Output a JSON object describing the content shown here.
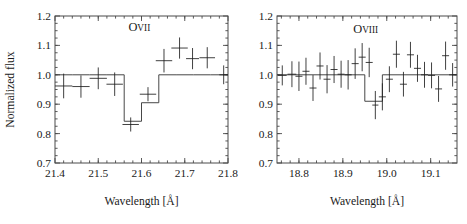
{
  "figure": {
    "background": "#ffffff",
    "ink_color": "#1a1a1a",
    "panel_count": 2
  },
  "axis_labels": {
    "x": "Wavelength [Å]",
    "y": "Normalized flux"
  },
  "chart_data": [
    {
      "type": "line",
      "panel": "left",
      "title": "",
      "annotation": {
        "text_major": "O",
        "text_minor": "VII",
        "x": 21.595,
        "y": 1.148
      },
      "xlabel": "Wavelength [Å]",
      "ylabel": "Normalized flux",
      "xlim": [
        21.4,
        21.8
      ],
      "ylim": [
        0.7,
        1.2
      ],
      "xticks": [
        21.4,
        21.5,
        21.6,
        21.7,
        21.8
      ],
      "xticklabels": [
        "21.4",
        "21.5",
        "21.6",
        "21.7",
        "21.8"
      ],
      "yticks": [
        0.7,
        0.8,
        0.9,
        1.0,
        1.1,
        1.2
      ],
      "yticklabels": [
        "0.7",
        "0.8",
        "0.9",
        "1.0",
        "1.1",
        "1.2"
      ],
      "xminor_step": 0.02,
      "yminor_step": 0.025,
      "grid": false,
      "legend": null,
      "series": [
        {
          "name": "model",
          "kind": "step",
          "edges": [
            21.4,
            21.44,
            21.48,
            21.52,
            21.56,
            21.6,
            21.64,
            21.68,
            21.72,
            21.76,
            21.8
          ],
          "values": [
            1.0,
            1.0,
            1.0,
            1.0,
            0.842,
            0.905,
            1.0,
            1.0,
            1.0,
            1.0
          ]
        },
        {
          "name": "data",
          "kind": "errorbar",
          "x": [
            21.42,
            21.46,
            21.5,
            21.538,
            21.575,
            21.615,
            21.652,
            21.688,
            21.718,
            21.752,
            21.79
          ],
          "xerr": [
            0.02,
            0.02,
            0.02,
            0.019,
            0.019,
            0.019,
            0.019,
            0.019,
            0.015,
            0.018,
            0.01
          ],
          "y": [
            0.962,
            0.96,
            0.988,
            0.968,
            0.831,
            0.934,
            1.048,
            1.091,
            1.055,
            1.058,
            1.0
          ],
          "yerr": [
            0.042,
            0.038,
            0.037,
            0.04,
            0.024,
            0.024,
            0.04,
            0.036,
            0.036,
            0.036,
            0.032
          ]
        }
      ]
    },
    {
      "type": "line",
      "panel": "right",
      "title": "",
      "annotation": {
        "text_major": "O",
        "text_minor": "VIII",
        "x": 18.952,
        "y": 1.142
      },
      "xlabel": "Wavelength [Å]",
      "ylabel": "",
      "xlim": [
        18.75,
        19.16
      ],
      "ylim": [
        0.7,
        1.2
      ],
      "xticks": [
        18.8,
        18.9,
        19.0,
        19.1
      ],
      "xticklabels": [
        "18.8",
        "18.9",
        "19.0",
        "19.1"
      ],
      "yticks": [
        0.7,
        0.8,
        0.9,
        1.0,
        1.1,
        1.2
      ],
      "yticklabels": [
        "0.7",
        "0.8",
        "0.9",
        "1.0",
        "1.1",
        "1.2"
      ],
      "xminor_step": 0.02,
      "yminor_step": 0.025,
      "grid": false,
      "legend": null,
      "series": [
        {
          "name": "model",
          "kind": "step",
          "edges": [
            18.75,
            18.95,
            18.99,
            19.16
          ],
          "values": [
            1.0,
            0.91,
            1.0
          ]
        },
        {
          "name": "data",
          "kind": "errorbar",
          "x": [
            18.762,
            18.784,
            18.8,
            18.816,
            18.832,
            18.848,
            18.864,
            18.88,
            18.896,
            18.912,
            18.928,
            18.944,
            18.96,
            18.974,
            18.99,
            19.006,
            19.022,
            19.038,
            19.054,
            19.07,
            19.086,
            19.102,
            19.118,
            19.134,
            19.15
          ],
          "xerr": [
            0.01,
            0.01,
            0.008,
            0.008,
            0.008,
            0.008,
            0.008,
            0.008,
            0.008,
            0.008,
            0.008,
            0.008,
            0.008,
            0.007,
            0.008,
            0.008,
            0.008,
            0.008,
            0.008,
            0.008,
            0.008,
            0.008,
            0.008,
            0.008,
            0.008
          ],
          "y": [
            0.998,
            1.002,
            0.995,
            1.012,
            0.955,
            1.03,
            0.985,
            1.018,
            1.002,
            1.0,
            1.038,
            1.06,
            1.042,
            0.897,
            0.925,
            0.985,
            1.07,
            0.968,
            1.068,
            1.022,
            1.0,
            0.998,
            0.952,
            1.065,
            1.0
          ],
          "yerr": [
            0.034,
            0.044,
            0.05,
            0.046,
            0.044,
            0.046,
            0.048,
            0.046,
            0.046,
            0.05,
            0.052,
            0.048,
            0.05,
            0.048,
            0.046,
            0.044,
            0.046,
            0.042,
            0.044,
            0.046,
            0.044,
            0.044,
            0.044,
            0.048,
            0.04
          ]
        }
      ]
    }
  ]
}
